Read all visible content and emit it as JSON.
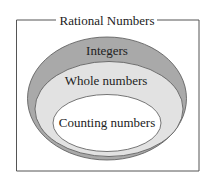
{
  "diagram": {
    "type": "nested-sets",
    "title": "Rational Numbers",
    "sets": [
      {
        "label": "Integers",
        "color": "#a9a9a9"
      },
      {
        "label": "Whole numbers",
        "color": "#e2e2e2"
      },
      {
        "label": "Counting numbers",
        "color": "#ffffff"
      }
    ],
    "colors": {
      "border": "#444444",
      "background": "#ffffff"
    }
  }
}
